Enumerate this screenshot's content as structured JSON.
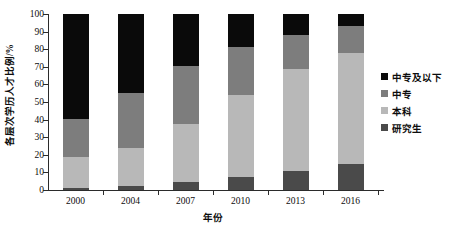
{
  "chart_data": {
    "type": "bar",
    "subtype": "stacked-100-percent",
    "title": "",
    "xlabel": "年份",
    "ylabel": "各层次学历人才比例/%",
    "categories": [
      "2000",
      "2004",
      "2007",
      "2010",
      "2013",
      "2016"
    ],
    "ylim": [
      0,
      100
    ],
    "yticks": [
      0,
      10,
      20,
      30,
      40,
      50,
      60,
      70,
      80,
      90,
      100
    ],
    "grid": false,
    "legend_position": "right",
    "stack_order_bottom_to_top": [
      "研究生",
      "本科",
      "中专",
      "中专及以下"
    ],
    "series": [
      {
        "name": "研究生",
        "color": "#4a4a4a",
        "values": [
          1,
          2,
          4.5,
          7.5,
          11,
          14.5
        ]
      },
      {
        "name": "本科",
        "color": "#b8b8b8",
        "values": [
          17.5,
          22,
          33,
          46.5,
          57.5,
          63.5
        ]
      },
      {
        "name": "中专",
        "color": "#7d7d7d",
        "values": [
          22,
          31,
          33,
          27,
          19.5,
          15
        ]
      },
      {
        "name": "中专及以下",
        "color": "#0a0a0a",
        "values": [
          59.5,
          45,
          29.5,
          19,
          12,
          7
        ]
      }
    ],
    "cumulative_tops": {
      "研究生": [
        1,
        2,
        4.5,
        7.5,
        11,
        14.5
      ],
      "本科": [
        18.5,
        24,
        37.5,
        54,
        68.5,
        78
      ],
      "中专": [
        40.5,
        55,
        70.5,
        81,
        88,
        93
      ],
      "中专及以下": [
        100,
        100,
        100,
        100,
        100,
        100
      ]
    }
  },
  "legend": {
    "entries": [
      {
        "label": "中专及以下",
        "color": "#0a0a0a"
      },
      {
        "label": "中专",
        "color": "#7d7d7d"
      },
      {
        "label": "本科",
        "color": "#b8b8b8"
      },
      {
        "label": "研究生",
        "color": "#4a4a4a"
      }
    ]
  },
  "axes": {
    "y_title": "各层次学历人才比例/%",
    "x_title": "年份",
    "y_tick_labels": [
      "100",
      "90",
      "80",
      "70",
      "60",
      "50",
      "40",
      "30",
      "20",
      "10",
      "0"
    ],
    "x_tick_labels": [
      "2000",
      "2004",
      "2007",
      "2010",
      "2013",
      "2016"
    ]
  }
}
